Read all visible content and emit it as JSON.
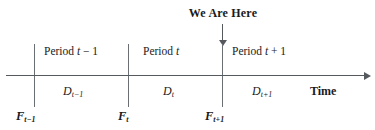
{
  "diagram": {
    "marker": {
      "label": "We Are Here",
      "points_to": "F_t+1",
      "arrow_direction": "down"
    },
    "axis": {
      "caption": "Time",
      "direction": "right",
      "color": "#555a5e"
    },
    "periods": [
      {
        "id": "prev",
        "label_prefix": "Period ",
        "label_var": "t",
        "label_suffix": " − 1"
      },
      {
        "id": "cur",
        "label_prefix": "Period ",
        "label_var": "t",
        "label_suffix": ""
      },
      {
        "id": "next",
        "label_prefix": "Period ",
        "label_var": "t",
        "label_suffix": " + 1"
      }
    ],
    "demands": [
      {
        "id": "prev",
        "symbol": "D",
        "subscript": "t−1"
      },
      {
        "id": "cur",
        "symbol": "D",
        "subscript": "t"
      },
      {
        "id": "next",
        "symbol": "D",
        "subscript": "t+1"
      }
    ],
    "forecasts": [
      {
        "id": "prev",
        "symbol": "F",
        "subscript": "t−1"
      },
      {
        "id": "cur",
        "symbol": "F",
        "subscript": "t"
      },
      {
        "id": "next",
        "symbol": "F",
        "subscript": "t+1"
      }
    ],
    "boundaries": [
      {
        "id": "b1",
        "at": "F_t-1"
      },
      {
        "id": "b2",
        "at": "F_t"
      },
      {
        "id": "b3",
        "at": "F_t+1"
      }
    ]
  }
}
